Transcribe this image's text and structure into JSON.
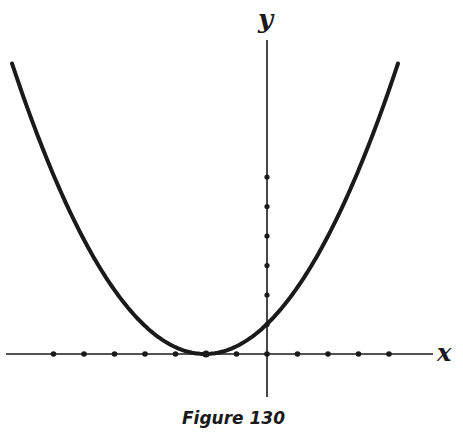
{
  "caption": "Figure 130",
  "axes": {
    "x_label": "x",
    "y_label": "y"
  },
  "colors": {
    "ink": "#1a1a1a",
    "background": "#ffffff"
  },
  "chart_data": {
    "type": "line",
    "title": "Figure 130",
    "xlabel": "x",
    "ylabel": "y",
    "grid": false,
    "legend": null,
    "equation_estimate": "y = (x + 2)^2 / 4",
    "vertex": [
      -2,
      0
    ],
    "y_intercept": 1,
    "x_tick_marks": [
      -7,
      -6,
      -5,
      -4,
      -3,
      -2,
      -1,
      0,
      1,
      2,
      3,
      4
    ],
    "y_tick_marks": [
      0,
      1,
      2,
      3,
      4,
      5,
      6
    ],
    "xlim": [
      -8.5,
      5.5
    ],
    "ylim": [
      -1.4,
      10.5
    ],
    "series": [
      {
        "name": "parabola",
        "x": [
          -8.3,
          -7,
          -6,
          -5,
          -4,
          -3,
          -2,
          -1,
          0,
          1,
          2,
          3,
          4.3
        ],
        "y": [
          9.9,
          6.25,
          4.0,
          2.25,
          1.0,
          0.25,
          0.0,
          0.25,
          1.0,
          2.25,
          4.0,
          6.25,
          9.9
        ]
      }
    ],
    "geometry_px": {
      "origin": [
        267,
        354
      ],
      "unit_px": 30.5,
      "curve_k": 0.0078,
      "vertex_px": [
        205,
        354
      ],
      "curve_x_range_px": [
        12,
        398
      ]
    }
  }
}
